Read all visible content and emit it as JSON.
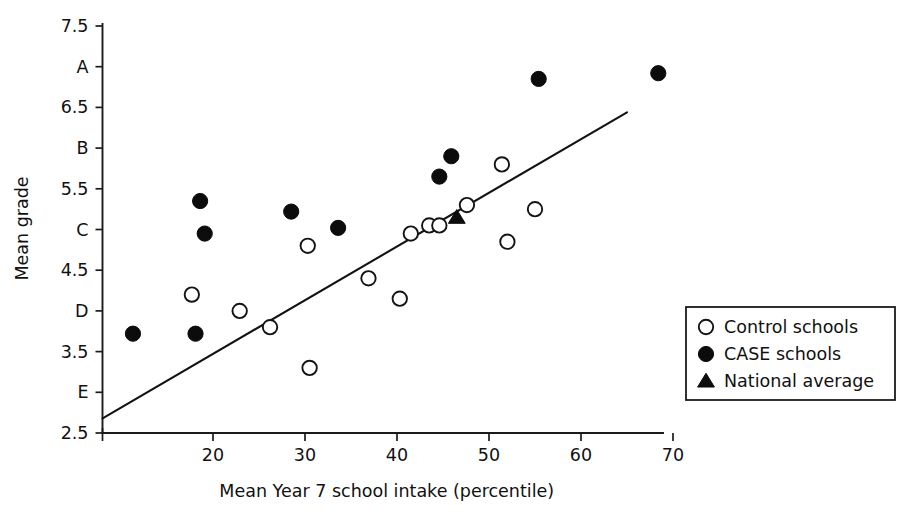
{
  "chart_data": {
    "type": "scatter",
    "title": "",
    "xlabel": "Mean Year 7 school intake (percentile)",
    "ylabel": "Mean grade",
    "xlim": [
      8,
      75
    ],
    "ylim": [
      2.5,
      7.5
    ],
    "grid": false,
    "x_ticks": [
      20,
      30,
      40,
      50,
      60,
      70
    ],
    "x_tick_labels": [
      "20",
      "30",
      "40",
      "50",
      "60",
      "70"
    ],
    "y_ticks": [
      7.5,
      7.0,
      6.5,
      6.0,
      5.5,
      5.0,
      4.5,
      4.0,
      3.5,
      3.0,
      2.5
    ],
    "y_tick_labels": [
      "7.5",
      "A",
      "6.5",
      "B",
      "5.5",
      "C",
      "4.5",
      "D",
      "3.5",
      "E",
      "2.5"
    ],
    "legend_position": "right",
    "series": [
      {
        "name": "Control schools",
        "marker": "open-circle",
        "color": "#ffffff",
        "edge_color": "#141414",
        "points": [
          {
            "x": 17.7,
            "y": 4.2
          },
          {
            "x": 22.9,
            "y": 4.0
          },
          {
            "x": 26.2,
            "y": 3.8
          },
          {
            "x": 30.3,
            "y": 4.8
          },
          {
            "x": 30.5,
            "y": 3.3
          },
          {
            "x": 36.9,
            "y": 4.4
          },
          {
            "x": 40.3,
            "y": 4.15
          },
          {
            "x": 41.5,
            "y": 4.95
          },
          {
            "x": 43.5,
            "y": 5.05
          },
          {
            "x": 44.6,
            "y": 5.05
          },
          {
            "x": 47.6,
            "y": 5.3
          },
          {
            "x": 51.4,
            "y": 5.8
          },
          {
            "x": 52.0,
            "y": 4.85
          },
          {
            "x": 55.0,
            "y": 5.25
          }
        ]
      },
      {
        "name": "CASE schools",
        "marker": "filled-circle",
        "color": "#0c0c0c",
        "edge_color": "#0c0c0c",
        "points": [
          {
            "x": 11.3,
            "y": 3.72
          },
          {
            "x": 18.1,
            "y": 3.72
          },
          {
            "x": 18.6,
            "y": 5.35
          },
          {
            "x": 19.1,
            "y": 4.95
          },
          {
            "x": 28.5,
            "y": 5.22
          },
          {
            "x": 33.6,
            "y": 5.02
          },
          {
            "x": 44.6,
            "y": 5.65
          },
          {
            "x": 45.9,
            "y": 5.9
          },
          {
            "x": 55.4,
            "y": 6.85
          },
          {
            "x": 68.4,
            "y": 6.92
          }
        ]
      },
      {
        "name": "National average",
        "marker": "filled-triangle",
        "color": "#0c0c0c",
        "edge_color": "#0c0c0c",
        "points": [
          {
            "x": 46.5,
            "y": 5.15
          }
        ]
      }
    ],
    "trend_line": {
      "name": "regression line",
      "x0": 8.0,
      "y0": 2.68,
      "x1": 65.0,
      "y1": 6.44
    }
  },
  "legend": {
    "items": [
      {
        "label": "Control schools",
        "marker": "open-circle"
      },
      {
        "label": "CASE schools",
        "marker": "filled-circle"
      },
      {
        "label": "National average",
        "marker": "filled-triangle"
      }
    ]
  }
}
